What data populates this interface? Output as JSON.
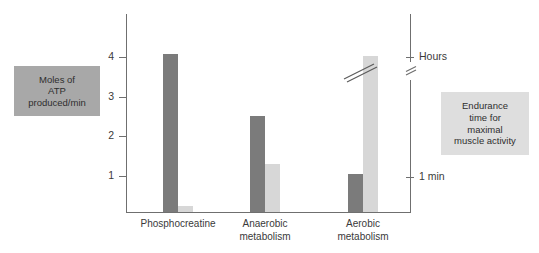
{
  "figure": {
    "left_axis_label_lines": [
      "Moles of",
      "ATP",
      "produced/min"
    ],
    "right_axis_label_lines": [
      "Endurance",
      "time for",
      "maximal",
      "muscle activity"
    ],
    "left_label_bg": "#a8a8a8",
    "right_label_bg": "#dedede"
  },
  "chart_data": {
    "type": "bar",
    "title": "",
    "xlabel": "",
    "ylabel": "Moles of ATP produced/min",
    "ylim": [
      0,
      4.9
    ],
    "grid": false,
    "legend_position": "none",
    "categories": [
      "Phosphocreatine",
      "Anaerobic metabolism",
      "Aerobic metabolism"
    ],
    "category_label_lines": [
      [
        "Phosphocreatine"
      ],
      [
        "Anaerobic",
        "metabolism"
      ],
      [
        "Aerobic",
        "metabolism"
      ]
    ],
    "yticks": [
      1,
      2,
      3,
      4
    ],
    "ytick_labels": [
      "1",
      "2",
      "3",
      "4"
    ],
    "right_axis": {
      "label": "Endurance time for maximal muscle activity",
      "ticks": [
        {
          "label": "Hours",
          "value": 4.0
        },
        {
          "label": "1 min",
          "value": 1.0
        }
      ],
      "has_break": true,
      "break_value": 3.6
    },
    "series": [
      {
        "name": "Moles of ATP produced/min",
        "color": "#7b7b7b",
        "axis": "left",
        "values": [
          3.97,
          2.43,
          0.95
        ]
      },
      {
        "name": "Endurance time for maximal muscle activity",
        "color": "#d7d7d7",
        "axis": "right",
        "values": [
          0.15,
          1.22,
          3.93
        ],
        "value_clipped": [
          false,
          false,
          true
        ],
        "clipped_note": "Aerobic metabolism bar is broken (axis break) — extends beyond scale"
      }
    ]
  },
  "ticks": {
    "y4": "4",
    "y3": "3",
    "y2": "2",
    "y1": "1",
    "r_hours": "Hours",
    "r_1min": "1 min"
  },
  "labels": {
    "left_l1": "Moles of",
    "left_l2": "ATP",
    "left_l3": "produced/min",
    "right_l1": "Endurance",
    "right_l2": "time for",
    "right_l3": "maximal",
    "right_l4": "muscle activity",
    "cat1_l1": "Phosphocreatine",
    "cat2_l1": "Anaerobic",
    "cat2_l2": "metabolism",
    "cat3_l1": "Aerobic",
    "cat3_l2": "metabolism"
  }
}
